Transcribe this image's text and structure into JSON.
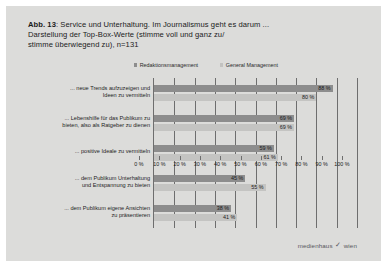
{
  "figure": {
    "number_label": "Abb. 13",
    "caption_rest": ": Service und Unterhaltung. Im Journalismus geht es darum ...",
    "caption_line2": "Darstellung der Top-Box-Werte (stimme voll und ganz zu/",
    "caption_line3": "stimme überwiegend zu), n=131"
  },
  "footer": {
    "brand_left": "medienhaus",
    "brand_mark": "✓",
    "brand_right": "wien"
  },
  "colors": {
    "series_a": "#8d8d8d",
    "series_b": "#c4c4c2",
    "background": "#dcdcda",
    "axis": "#6e6e6e"
  },
  "chart_data": {
    "type": "bar",
    "orientation": "horizontal",
    "grouped": true,
    "title": "Service und Unterhaltung. Im Journalismus geht es darum ...",
    "xlabel": "",
    "ylabel": "",
    "xlim": [
      0,
      100
    ],
    "grid": true,
    "legend_position": "top",
    "tick_labels": [
      "0 %",
      "10 %",
      "20 %",
      "30 %",
      "40 %",
      "50 %",
      "60 %",
      "70 %",
      "80 %",
      "90 %",
      "100 %"
    ],
    "ticks": [
      0,
      10,
      20,
      30,
      40,
      50,
      60,
      70,
      80,
      90,
      100
    ],
    "categories": [
      "... neue Trends aufzuzeigen und\nIdeen zu vermitteln",
      "... Lebenshilfe für das Publikum zu\nbieten, also als Ratgeber zu dienen",
      "... positive Ideale zu vermitteln",
      "... dem Publikum Unterhaltung\nund Entspannung zu bieten",
      "... dem Publikum eigene Ansichten\nzu präsentieren"
    ],
    "series": [
      {
        "name": "Redaktionsmanagement",
        "color": "#8d8d8d",
        "values": [
          88,
          69,
          59,
          45,
          38
        ],
        "labels": [
          "88 %",
          "69 %",
          "59 %",
          "45 %",
          "38 %"
        ]
      },
      {
        "name": "General Management",
        "color": "#c4c4c2",
        "values": [
          80,
          69,
          61,
          55,
          41
        ],
        "labels": [
          "80 %",
          "69 %",
          "61 %",
          "55 %",
          "41 %"
        ]
      }
    ]
  }
}
